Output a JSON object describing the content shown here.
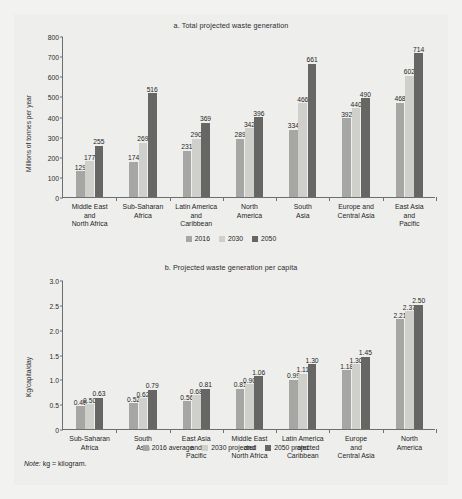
{
  "note": {
    "prefix": "Note:",
    "text": " kg = kilogram."
  },
  "colors": {
    "c2016": "#a6a6a4",
    "c2030": "#cfcfcb",
    "c2050": "#666664",
    "panel": "#eeeeec",
    "axis": "#6e6e6e"
  },
  "chart_data": [
    {
      "type": "bar",
      "id": "a",
      "title": "a. Total projected waste generation",
      "xlabel": "",
      "ylabel": "Millions of tonnes per year",
      "ylim": [
        0,
        800
      ],
      "yticks": [
        0,
        100,
        200,
        300,
        400,
        500,
        600,
        700,
        800
      ],
      "ytick_labels": [
        "0",
        "100",
        "200",
        "300",
        "400",
        "500",
        "600",
        "700",
        "800"
      ],
      "grid": false,
      "legend_position": "bottom",
      "categories": [
        "Middle East and North Africa",
        "Sub-Saharan Africa",
        "Latin America and Caribbean",
        "North America",
        "South Asia",
        "Europe and Central Asia",
        "East Asia and Pacific"
      ],
      "category_lines": [
        [
          "Middle East",
          "and",
          "North Africa"
        ],
        [
          "Sub-Saharan",
          "Africa"
        ],
        [
          "Latin America",
          "and",
          "Caribbean"
        ],
        [
          "North",
          "America"
        ],
        [
          "South",
          "Asia"
        ],
        [
          "Europe and",
          "Central Asia"
        ],
        [
          "East Asia",
          "and",
          "Pacific"
        ]
      ],
      "series": [
        {
          "name": "2016",
          "values": [
            129,
            174,
            231,
            289,
            334,
            392,
            468
          ]
        },
        {
          "name": "2030",
          "values": [
            177,
            269,
            290,
            342,
            466,
            440,
            602
          ]
        },
        {
          "name": "2050",
          "values": [
            255,
            516,
            369,
            396,
            661,
            490,
            714
          ]
        }
      ],
      "legend": [
        "2016",
        "2030",
        "2050"
      ]
    },
    {
      "type": "bar",
      "id": "b",
      "title": "b. Projected waste generation per capita",
      "xlabel": "",
      "ylabel": "Kg/capita/day",
      "ylim": [
        0,
        3.0
      ],
      "yticks": [
        0,
        0.5,
        1.0,
        1.5,
        2.0,
        2.5,
        3.0
      ],
      "ytick_labels": [
        "0",
        "0.5",
        "1.0",
        "1.5",
        "2.0",
        "2.5",
        "3.0"
      ],
      "grid": false,
      "legend_position": "bottom",
      "categories": [
        "Sub-Saharan Africa",
        "South Asia",
        "East Asia and Pacific",
        "Middle East and North Africa",
        "Latin America and Caribbean",
        "Europe and Central Asia",
        "North America"
      ],
      "category_lines": [
        [
          "Sub-Saharan",
          "Africa"
        ],
        [
          "South",
          "Asia"
        ],
        [
          "East Asia",
          "and",
          "Pacific"
        ],
        [
          "Middle East",
          "and",
          "North Africa"
        ],
        [
          "Latin America",
          "and",
          "Caribbean"
        ],
        [
          "Europe",
          "and",
          "Central Asia"
        ],
        [
          "North",
          "America"
        ]
      ],
      "series": [
        {
          "name": "2016 average",
          "values": [
            0.46,
            0.52,
            0.56,
            0.81,
            0.99,
            1.18,
            2.21
          ]
        },
        {
          "name": "2030 projected",
          "values": [
            0.5,
            0.62,
            0.68,
            0.9,
            1.11,
            1.3,
            2.37
          ]
        },
        {
          "name": "2050 projected",
          "values": [
            0.63,
            0.79,
            0.81,
            1.06,
            1.3,
            1.45,
            2.5
          ]
        }
      ],
      "value_labels": [
        [
          "0.46",
          "0.52",
          "0.56",
          "0.81",
          "0.99",
          "1.18",
          "2.21"
        ],
        [
          "0.50",
          "0.62",
          "0.68",
          "0.90",
          "1.11",
          "1.30",
          "2.37"
        ],
        [
          "0.63",
          "0.79",
          "0.81",
          "1.06",
          "1.30",
          "1.45",
          "2.50"
        ]
      ],
      "legend": [
        "2016 average",
        "2030 projected",
        "2050 projected"
      ]
    }
  ]
}
